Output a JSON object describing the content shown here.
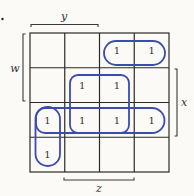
{
  "diagram": {
    "type": "karnaugh-map",
    "size": "4x4",
    "variables": {
      "top": "y",
      "left": "w",
      "right": "x",
      "bottom": "z"
    },
    "cells": [
      [
        "",
        "",
        "1",
        "1"
      ],
      [
        "",
        "1",
        "1",
        ""
      ],
      [
        "1",
        "1",
        "1",
        "1"
      ],
      [
        "1",
        "",
        "",
        ""
      ]
    ],
    "groupings": [
      {
        "name": "row0-cols2-3",
        "cells": [
          [
            0,
            2
          ],
          [
            0,
            3
          ]
        ]
      },
      {
        "name": "square-rows1-2-cols1-2",
        "cells": [
          [
            1,
            1
          ],
          [
            1,
            2
          ],
          [
            2,
            1
          ],
          [
            2,
            2
          ]
        ]
      },
      {
        "name": "row2-all",
        "cells": [
          [
            2,
            0
          ],
          [
            2,
            1
          ],
          [
            2,
            2
          ],
          [
            2,
            3
          ]
        ]
      },
      {
        "name": "col0-rows2-3",
        "cells": [
          [
            2,
            0
          ],
          [
            3,
            0
          ]
        ]
      }
    ],
    "colors": {
      "grid": "#2a2a2a",
      "loops": "#3a4cb0",
      "background": "#fbfaf6"
    }
  }
}
